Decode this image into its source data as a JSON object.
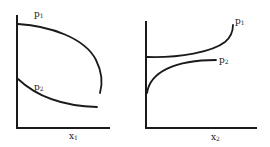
{
  "diagram": {
    "panels": [
      {
        "id": "left",
        "x_axis_label": "x",
        "x_axis_sub": "1",
        "curves": [
          {
            "label": "p",
            "sub": "1",
            "shape": "concave arc from y-axis bending down to the right"
          },
          {
            "label": "p",
            "sub": "2",
            "shape": "decreasing convex curve from y-axis"
          }
        ]
      },
      {
        "id": "right",
        "x_axis_label": "x",
        "x_axis_sub": "2",
        "curves": [
          {
            "label": "p",
            "sub": "1",
            "shape": "increasing convex curve rising steeply at right"
          },
          {
            "label": "p",
            "sub": "2",
            "shape": "increasing concave curve leveling off"
          }
        ]
      }
    ],
    "colors": {
      "ink": "#1a1a1a",
      "background": "#ffffff"
    }
  }
}
